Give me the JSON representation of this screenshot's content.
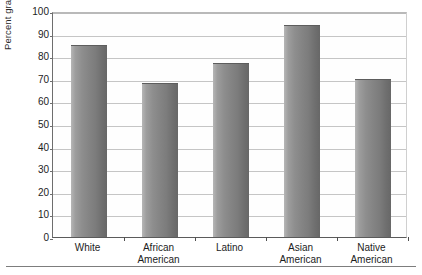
{
  "chart_data": {
    "type": "bar",
    "title": "",
    "xlabel": "",
    "ylabel": "Percent graduating",
    "ylim": [
      0,
      100
    ],
    "ytick_step": 10,
    "grid": true,
    "legend": "none",
    "orientation": "vertical",
    "categories": [
      "White",
      "African American",
      "Latino",
      "Asian American",
      "Native American"
    ],
    "category_lines": [
      [
        "White",
        ""
      ],
      [
        "African",
        "American"
      ],
      [
        "Latino",
        ""
      ],
      [
        "Asian",
        "American"
      ],
      [
        "Native",
        "American"
      ]
    ],
    "values": [
      85,
      68,
      77,
      94,
      70
    ],
    "ytick_labels": [
      "100",
      "90",
      "80",
      "70",
      "60",
      "50",
      "40",
      "30",
      "20",
      "10",
      "0"
    ],
    "ytick_values": [
      100,
      90,
      80,
      70,
      60,
      50,
      40,
      30,
      20,
      10,
      0
    ],
    "bar_color": "#848484",
    "grid_color": "#c5c5c5",
    "axis_color": "#5a5a5a"
  }
}
